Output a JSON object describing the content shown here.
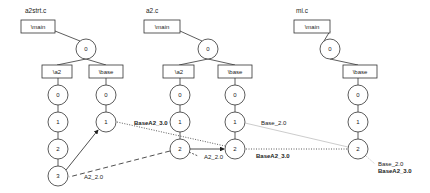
{
  "diagram": {
    "files": [
      {
        "name": "a2strt.c",
        "main": "\\main",
        "root": "0",
        "branches": [
          {
            "label": "\\a2",
            "nodes": [
              "0",
              "1",
              "2",
              "3"
            ]
          },
          {
            "label": "\\base",
            "nodes": [
              "0",
              "1"
            ]
          }
        ]
      },
      {
        "name": "a2.c",
        "main": "\\main",
        "root": "0",
        "branches": [
          {
            "label": "\\a2",
            "nodes": [
              "0",
              "1",
              "2"
            ]
          },
          {
            "label": "\\base",
            "nodes": [
              "0",
              "1",
              "2"
            ]
          }
        ]
      },
      {
        "name": "mi.c",
        "main": "\\main",
        "root": "0",
        "branches": [
          {
            "label": "\\base",
            "nodes": [
              "0",
              "1",
              "2"
            ]
          }
        ]
      }
    ],
    "edge_labels": {
      "basea2_30_top": "BaseA2_3.0",
      "a2_20_left": "A2_2.0",
      "a2_20_mid": "A2_2.0",
      "base_20_mid": "Base_2.0",
      "basea2_30_mid": "BaseA2_3.0",
      "base_20_right": "Base_2.0",
      "basea2_30_right": "BaseA2_3.0"
    }
  }
}
